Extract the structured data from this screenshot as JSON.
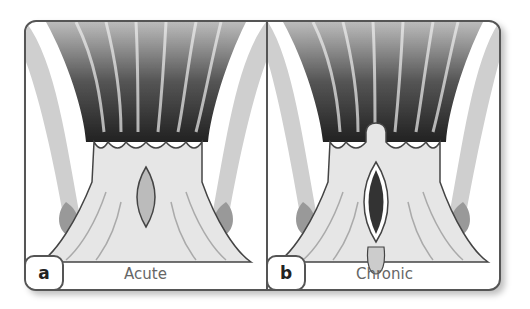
{
  "figure": {
    "panels": [
      {
        "letter": "a",
        "caption": "Acute"
      },
      {
        "letter": "b",
        "caption": "Chronic"
      }
    ]
  },
  "colors": {
    "frame": "#555555",
    "tissue_dark": "#2a2a2a",
    "tissue_light": "#e8e8e8",
    "background": "#ffffff"
  }
}
